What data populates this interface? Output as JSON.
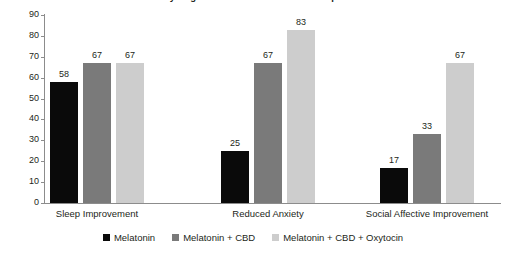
{
  "chart_data": {
    "type": "bar",
    "title": "Synergistic and Additive Relationships",
    "xlabel": "",
    "ylabel": "",
    "ylim": [
      0,
      90
    ],
    "yticks": [
      0,
      10,
      20,
      30,
      40,
      50,
      60,
      70,
      80,
      90
    ],
    "grid": false,
    "legend_position": "bottom",
    "categories": [
      "Sleep Improvement",
      "Reduced Anxiety",
      "Social Affective Improvement"
    ],
    "series": [
      {
        "name": "Melatonin",
        "color": "#0a0a0a",
        "values": [
          58,
          25,
          17
        ]
      },
      {
        "name": "Melatonin + CBD",
        "color": "#7a7a7a",
        "values": [
          67,
          67,
          33
        ]
      },
      {
        "name": "Melatonin + CBD + Oxytocin",
        "color": "#cdcdcd",
        "values": [
          67,
          83,
          67
        ]
      }
    ]
  },
  "axis": {
    "line_color": "#8c8c8c"
  }
}
